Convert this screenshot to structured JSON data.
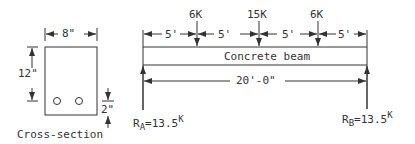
{
  "cross_section": {
    "width_label": "8\"",
    "height_label": "12\"",
    "cover_label": "2\"",
    "caption": "Cross-section",
    "bar_count": 2
  },
  "beam": {
    "label": "Concrete beam",
    "span_label": "20'-0\"",
    "segments": [
      "5'",
      "5'",
      "5'",
      "5'"
    ],
    "loads": [
      {
        "label": "6K",
        "position_ft": 5
      },
      {
        "label": "15K",
        "position_ft": 10
      },
      {
        "label": "6K",
        "position_ft": 15
      }
    ],
    "reactions": {
      "left": {
        "name": "R",
        "sub": "A",
        "value": "=13.5",
        "sup": "K"
      },
      "right": {
        "name": "R",
        "sub": "B",
        "value": "=13.5",
        "sup": "K"
      }
    }
  }
}
